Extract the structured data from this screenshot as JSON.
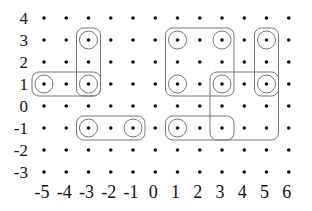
{
  "diagram": {
    "x_axis": {
      "ticks": [
        -5,
        -4,
        -3,
        -2,
        -1,
        0,
        1,
        2,
        3,
        4,
        5,
        6
      ],
      "labels": [
        "-5",
        "-4",
        "-3",
        "-2",
        "-1",
        "0",
        "1",
        "2",
        "3",
        "4",
        "5",
        "6"
      ]
    },
    "y_axis": {
      "ticks": [
        4,
        3,
        2,
        1,
        0,
        -1,
        -2,
        -3
      ],
      "labels": [
        "4",
        "3",
        "2",
        "1",
        "0",
        "-1",
        "-2",
        "-3"
      ]
    },
    "circled_points": [
      {
        "x": -3,
        "y": 3
      },
      {
        "x": -5,
        "y": 1
      },
      {
        "x": -3,
        "y": 1
      },
      {
        "x": -3,
        "y": -1
      },
      {
        "x": -1,
        "y": -1
      },
      {
        "x": 1,
        "y": 3
      },
      {
        "x": 3,
        "y": 3
      },
      {
        "x": 1,
        "y": 1
      },
      {
        "x": 3,
        "y": 1
      },
      {
        "x": 5,
        "y": 3
      },
      {
        "x": 5,
        "y": 1
      },
      {
        "x": 1,
        "y": -1
      }
    ],
    "boxes": [
      {
        "name": "vertical-box-x-neg3",
        "x1": -3,
        "y1": 3,
        "x2": -3,
        "y2": 1
      },
      {
        "name": "horizontal-box-y1-left",
        "x1": -5,
        "y1": 1,
        "x2": -3,
        "y2": 1
      },
      {
        "name": "horizontal-box-y-neg1-left",
        "x1": -3,
        "y1": -1,
        "x2": -1,
        "y2": -1
      },
      {
        "name": "square-box-center",
        "x1": 1,
        "y1": 3,
        "x2": 3,
        "y2": 1
      },
      {
        "name": "vertical-box-x5",
        "x1": 5,
        "y1": 3,
        "x2": 5,
        "y2": 1
      },
      {
        "name": "horizontal-box-y-neg1-right",
        "x1": 1,
        "y1": -1,
        "x2": 3,
        "y2": -1
      },
      {
        "name": "large-box-right",
        "x1": 3,
        "y1": 1,
        "x2": 5,
        "y2": -1
      }
    ],
    "colors": {
      "dot": "#111111",
      "circle": "#777777",
      "box": "#777777",
      "label": "#111111"
    }
  }
}
